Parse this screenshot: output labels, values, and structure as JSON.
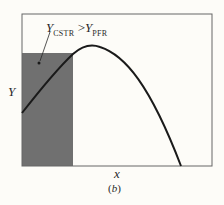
{
  "figure": {
    "caption_open": "(",
    "caption_letter": "b",
    "caption_close": ")",
    "x_axis_label": "x",
    "y_axis_label": "Y",
    "annotation": {
      "left_symbol": "Y",
      "left_sub": "CSTR",
      "operator": ">",
      "right_symbol": "Y",
      "right_sub": "PFR"
    },
    "colors": {
      "frame": "#555555",
      "shaded_region": "#707070",
      "curve": "#1a1a1a",
      "background": "#fdfcf8"
    }
  }
}
